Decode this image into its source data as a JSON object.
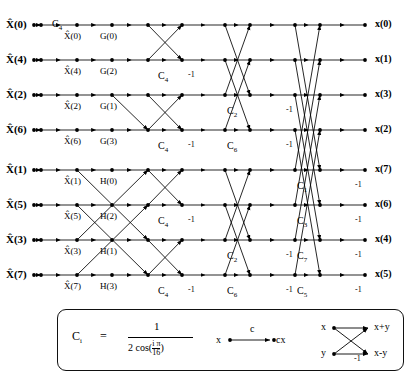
{
  "diagram": {
    "type": "signal-flow-graph",
    "inputs": [
      {
        "label": "X̂(0)",
        "row": 0
      },
      {
        "label": "X̂(4)",
        "row": 1
      },
      {
        "label": "X̂(2)",
        "row": 2
      },
      {
        "label": "X̂(6)",
        "row": 3
      },
      {
        "label": "X̂(1)",
        "row": 4
      },
      {
        "label": "X̂(5)",
        "row": 5
      },
      {
        "label": "X̂(3)",
        "row": 6
      },
      {
        "label": "X̂(7)",
        "row": 7
      }
    ],
    "outputs": [
      {
        "label": "x(0)",
        "row": 0
      },
      {
        "label": "x(1)",
        "row": 1
      },
      {
        "label": "x(3)",
        "row": 2
      },
      {
        "label": "x(2)",
        "row": 3
      },
      {
        "label": "x(7)",
        "row": 4
      },
      {
        "label": "x(6)",
        "row": 5
      },
      {
        "label": "x(4)",
        "row": 6
      },
      {
        "label": "x(5)",
        "row": 7
      }
    ],
    "stage1_labels": [
      {
        "label": "X̂(0)",
        "row": 0
      },
      {
        "label": "X̂(4)",
        "row": 1
      },
      {
        "label": "X̂(2)",
        "row": 2
      },
      {
        "label": "X̂(6)",
        "row": 3
      },
      {
        "label": "X̂(1)",
        "row": 4
      },
      {
        "label": "X̂(5)",
        "row": 5
      },
      {
        "label": "X̂(3)",
        "row": 6
      },
      {
        "label": "X̂(7)",
        "row": 7
      }
    ],
    "stage2_labels": [
      {
        "label": "G(0)",
        "row": 0
      },
      {
        "label": "G(2)",
        "row": 1
      },
      {
        "label": "G(1)",
        "row": 2
      },
      {
        "label": "G(3)",
        "row": 3
      },
      {
        "label": "H(0)",
        "row": 4
      },
      {
        "label": "H(2)",
        "row": 5
      },
      {
        "label": "H(1)",
        "row": 6
      },
      {
        "label": "H(3)",
        "row": 7
      }
    ],
    "coefficients": [
      {
        "name": "C",
        "sub": "4",
        "x": 52,
        "y": 18
      },
      {
        "name": "C",
        "sub": "4",
        "x": 158,
        "y": 70
      },
      {
        "name": "C",
        "sub": "4",
        "x": 158,
        "y": 140
      },
      {
        "name": "C",
        "sub": "2",
        "x": 227,
        "y": 105
      },
      {
        "name": "C",
        "sub": "6",
        "x": 227,
        "y": 140
      },
      {
        "name": "C",
        "sub": "4",
        "x": 158,
        "y": 215
      },
      {
        "name": "C",
        "sub": "4",
        "x": 158,
        "y": 285
      },
      {
        "name": "C",
        "sub": "2",
        "x": 227,
        "y": 250
      },
      {
        "name": "C",
        "sub": "6",
        "x": 227,
        "y": 285
      },
      {
        "name": "C",
        "sub": "1",
        "x": 297,
        "y": 180
      },
      {
        "name": "C",
        "sub": "3",
        "x": 297,
        "y": 215
      },
      {
        "name": "C",
        "sub": "7",
        "x": 297,
        "y": 250
      },
      {
        "name": "C",
        "sub": "5",
        "x": 297,
        "y": 285
      }
    ],
    "minus_ones": [
      {
        "label": "-1",
        "x": 188,
        "y": 70
      },
      {
        "label": "-1",
        "x": 188,
        "y": 140
      },
      {
        "label": "-1",
        "x": 188,
        "y": 215
      },
      {
        "label": "-1",
        "x": 188,
        "y": 285
      },
      {
        "label": "-1",
        "x": 286,
        "y": 105
      },
      {
        "label": "-1",
        "x": 286,
        "y": 140
      },
      {
        "label": "-1",
        "x": 286,
        "y": 250
      },
      {
        "label": "-1",
        "x": 286,
        "y": 285
      },
      {
        "label": "-1",
        "x": 355,
        "y": 180
      },
      {
        "label": "-1",
        "x": 355,
        "y": 215
      },
      {
        "label": "-1",
        "x": 355,
        "y": 250
      },
      {
        "label": "-1",
        "x": 355,
        "y": 285
      }
    ]
  },
  "legend": {
    "coef_symbol": "C",
    "coef_sub": "i",
    "equals": "=",
    "numerator": "1",
    "denom_prefix": "2 cos(",
    "denom_num": "i π",
    "denom_den": "16",
    "denom_suffix": ")",
    "mul_input": "x",
    "mul_coef": "c",
    "mul_output": "cx",
    "bf_in_top": "x",
    "bf_in_bottom": "y",
    "bf_out_top": "x+y",
    "bf_out_bottom": "x-y",
    "bf_minus": "-1"
  },
  "chart_data": {
    "type": "diagram",
    "rows_y": [
      25,
      60,
      95,
      130,
      170,
      205,
      240,
      275
    ],
    "columns_x": [
      41,
      77,
      112,
      148,
      182,
      225,
      250,
      295,
      320,
      365
    ]
  }
}
